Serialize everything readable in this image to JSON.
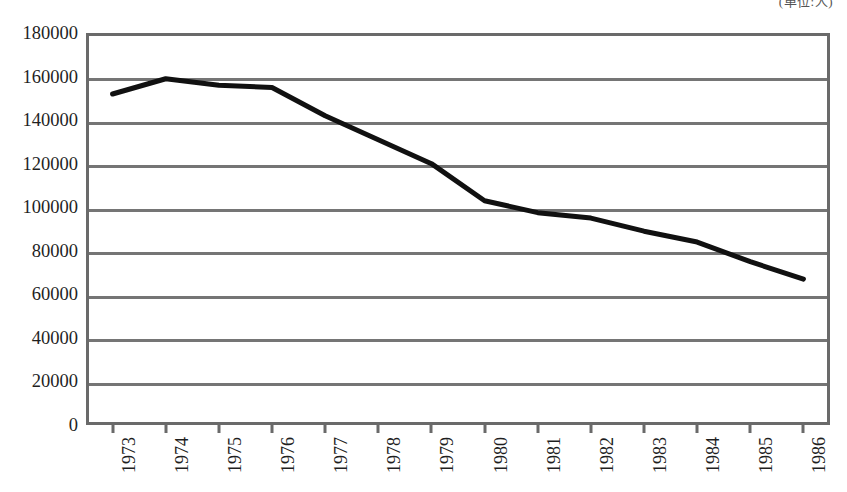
{
  "annotation": {
    "unit_note": "(単位:人)"
  },
  "chart_data": {
    "type": "line",
    "title": "",
    "subtitle": "",
    "xlabel": "",
    "ylabel": "",
    "categories": [
      "1973",
      "1974",
      "1975",
      "1976",
      "1977",
      "1978",
      "1979",
      "1980",
      "1981",
      "1982",
      "1983",
      "1984",
      "1985",
      "1986"
    ],
    "values": [
      152000,
      159000,
      156000,
      155000,
      142000,
      131000,
      120000,
      103000,
      97500,
      95000,
      89000,
      84000,
      75000,
      67000
    ],
    "series": [
      {
        "name": "",
        "values": [
          152000,
          159000,
          156000,
          155000,
          142000,
          131000,
          120000,
          103000,
          97500,
          95000,
          89000,
          84000,
          75000,
          67000
        ]
      }
    ],
    "ylim": [
      0,
      180000
    ],
    "ytick_step": 20000,
    "yticks": [
      0,
      20000,
      40000,
      60000,
      80000,
      100000,
      120000,
      140000,
      160000,
      180000
    ],
    "ytick_labels": [
      "0",
      "20000",
      "40000",
      "60000",
      "80000",
      "100000",
      "120000",
      "140000",
      "160000",
      "180000"
    ],
    "xtick_labels": [
      "1973",
      "1974",
      "1975",
      "1976",
      "1977",
      "1978",
      "1979",
      "1980",
      "1981",
      "1982",
      "1983",
      "1984",
      "1985",
      "1986"
    ],
    "xtick_rotation": -90,
    "grid": true,
    "grid_axis": "y",
    "legend": false,
    "legend_position": "none",
    "line_color": "#111111",
    "line_width": 5,
    "grid_color": "#757575",
    "frame_color": "#6a6a6a",
    "background_color": "#ffffff",
    "markers": false
  }
}
